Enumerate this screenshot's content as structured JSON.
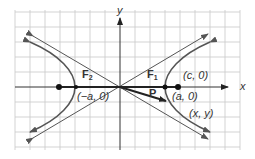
{
  "diagram": {
    "axes": {
      "x_label": "x",
      "y_label": "y"
    },
    "labels": {
      "focus1": "F",
      "focus1_sub": "1",
      "focus2": "F",
      "focus2_sub": "2",
      "point_p": "P",
      "focus1_coord": "(c, 0)",
      "vertex_right": "(a, 0)",
      "vertex_left": "(−a, 0)",
      "point_xy": "(x, y)"
    },
    "colors": {
      "grid": "#c8c8c8",
      "curve": "#555555",
      "axis": "#333333",
      "background": "#ffffff"
    }
  }
}
